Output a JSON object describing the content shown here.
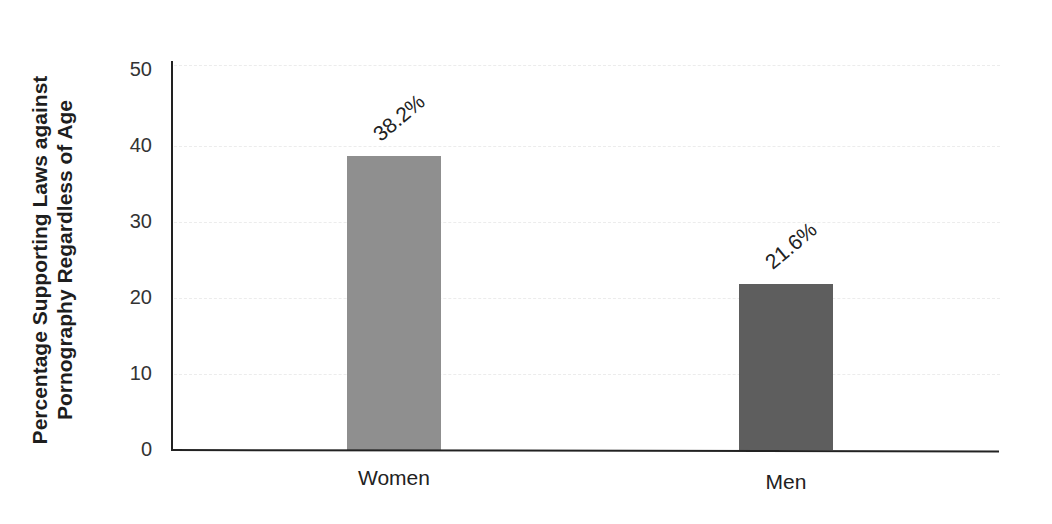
{
  "chart_data": {
    "type": "bar",
    "title": "",
    "xlabel": "",
    "ylabel": "Percentage Supporting Laws against Pornography Regardless of Age",
    "ylabel_lines": [
      "Percentage Supporting Laws against",
      "Pornography Regardless of Age"
    ],
    "categories": [
      "Women",
      "Men"
    ],
    "values": [
      38.2,
      21.6
    ],
    "data_labels": [
      "38.2%",
      "21.6%"
    ],
    "colors": [
      "#8f8f8f",
      "#5e5e5e"
    ],
    "ylim": [
      0,
      50
    ],
    "yticks": [
      0,
      10,
      20,
      30,
      40,
      50
    ],
    "grid": true,
    "legend": null
  },
  "axis": {
    "tick_labels": [
      "0",
      "10",
      "20",
      "30",
      "40",
      "50"
    ]
  }
}
